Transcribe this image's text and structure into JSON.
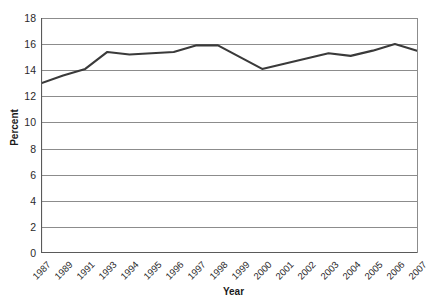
{
  "chart_data": {
    "type": "line",
    "title": "",
    "xlabel": "Year",
    "ylabel": "Percent",
    "categories": [
      "1987",
      "1989",
      "1991",
      "1993",
      "1994",
      "1995",
      "1996",
      "1997",
      "1998",
      "1999",
      "2000",
      "2001",
      "2002",
      "2003",
      "2004",
      "2005",
      "2006",
      "2007"
    ],
    "values": [
      13.0,
      13.6,
      14.1,
      15.4,
      15.2,
      15.3,
      15.4,
      15.9,
      15.9,
      15.0,
      14.1,
      14.5,
      14.9,
      15.3,
      15.1,
      15.5,
      16.0,
      15.5
    ],
    "ylim": [
      0,
      18
    ],
    "yticks": [
      "0",
      "2",
      "4",
      "6",
      "8",
      "10",
      "12",
      "14",
      "16",
      "18"
    ],
    "ytick_values": [
      0,
      2,
      4,
      6,
      8,
      10,
      12,
      14,
      16,
      18
    ],
    "grid": true,
    "legend": "none",
    "series_color": "#3a3a3a",
    "grid_color": "#8c8c8c",
    "axis_color": "#5a5a5a",
    "background": "#ffffff"
  }
}
